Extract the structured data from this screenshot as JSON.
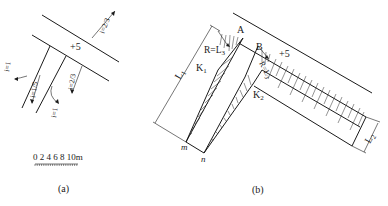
{
  "figure_a": {
    "caption": "(a)",
    "elevation": "+5",
    "slopes": {
      "main_road": "i=2/3",
      "branch_right": "i=2/3",
      "branch_left": "i=1/5",
      "branch_left_outer": "i=1",
      "branch_bottom": "i=1"
    },
    "scale_bar": {
      "labels": "0 2 4 6 8 10m"
    }
  },
  "figure_b": {
    "caption": "(b)",
    "elevation": "+5",
    "points": {
      "A": "A",
      "B": "B",
      "K1": "K",
      "K1_sub": "1",
      "K2": "K",
      "K2_sub": "2",
      "m": "m",
      "n": "n"
    },
    "labels": {
      "R_L3_left_R": "R=L",
      "R_L3_left_sub": "3",
      "R_L3_right": "R=L",
      "R_L3_right_sub": "3",
      "L1": "L",
      "L1_sub": "1",
      "L2": "L",
      "L2_sub": "2"
    }
  }
}
